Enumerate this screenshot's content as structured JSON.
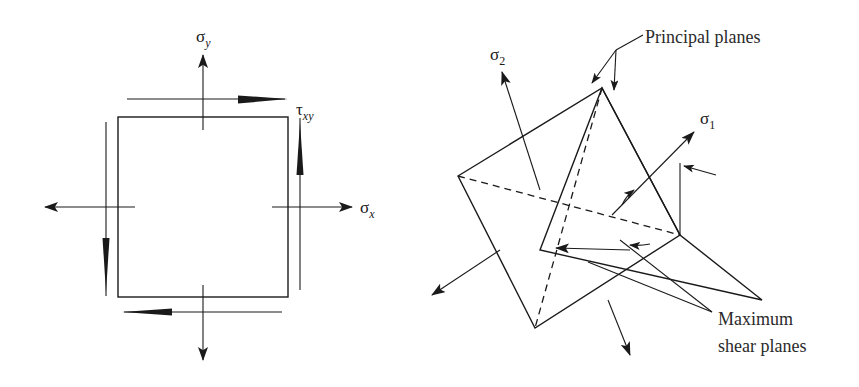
{
  "figure": {
    "background_color": "#ffffff",
    "ink_color": "#1a1a1a",
    "width": 859,
    "height": 387
  },
  "left_diagram": {
    "name": "plane-stress-element",
    "description": "Square element with normal stresses sigma-x, sigma-y and shear stress tau-xy",
    "labels": {
      "sigma_y": {
        "symbol": "σ",
        "subscript": "y",
        "x": 196,
        "y": 42
      },
      "sigma_x": {
        "symbol": "σ",
        "subscript": "x",
        "x": 360,
        "y": 213
      },
      "tau_xy": {
        "symbol": "τ",
        "subscript": "xy",
        "x": 296,
        "y": 115
      }
    },
    "element": {
      "left": 118,
      "top": 117,
      "right": 288,
      "bottom": 297
    },
    "arrows": [
      {
        "name": "sigma-y-up-arrow",
        "direction": "up"
      },
      {
        "name": "sigma-y-down-arrow",
        "direction": "down"
      },
      {
        "name": "sigma-x-right-arrow",
        "direction": "right"
      },
      {
        "name": "sigma-x-left-arrow",
        "direction": "left"
      },
      {
        "name": "tau-top-arrow",
        "direction": "right"
      },
      {
        "name": "tau-bottom-arrow",
        "direction": "left"
      },
      {
        "name": "tau-right-arrow",
        "direction": "up"
      },
      {
        "name": "tau-left-arrow",
        "direction": "down"
      }
    ]
  },
  "right_diagram": {
    "name": "principal-and-shear-planes",
    "description": "Two intersecting inclined planes showing principal planes and maximum shear planes with sigma-1 and sigma-2 stress arrows",
    "labels": {
      "principal_planes": {
        "text": "Principal planes",
        "x": 645,
        "y": 43
      },
      "maximum_shear_planes_line1": {
        "text": "Maximum",
        "x": 718,
        "y": 325
      },
      "maximum_shear_planes_line2": {
        "text": "shear planes",
        "x": 718,
        "y": 352
      },
      "sigma_1": {
        "symbol": "σ",
        "subscript": "1",
        "x": 700,
        "y": 124
      },
      "sigma_2": {
        "symbol": "σ",
        "subscript": "2",
        "x": 490,
        "y": 60
      }
    },
    "arrows": [
      {
        "name": "sigma-2-arrow",
        "direction": "up-left"
      },
      {
        "name": "sigma-2-opposite-arrow",
        "direction": "down-left"
      },
      {
        "name": "sigma-1-arrow",
        "direction": "up-right"
      },
      {
        "name": "sigma-1-opposite-arrow",
        "direction": "down-left"
      },
      {
        "name": "shear-arrow-upper-right",
        "direction": "up-right"
      },
      {
        "name": "shear-arrow-lower-left",
        "direction": "down-left"
      },
      {
        "name": "shear-arrow-right-inward",
        "direction": "left"
      },
      {
        "name": "shear-arrow-bottom",
        "direction": "down"
      },
      {
        "name": "principal-leader-arrow-left",
        "direction": "down-left"
      },
      {
        "name": "principal-leader-arrow-right",
        "direction": "down"
      }
    ]
  }
}
